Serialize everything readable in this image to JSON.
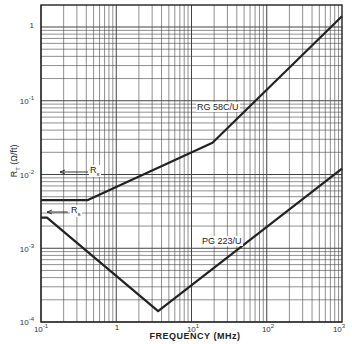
{
  "chart_data": {
    "type": "line",
    "title": "",
    "xlabel": "FREQUENCY (MHz)",
    "ylabel": "R_T (Ω/ft)",
    "xscale": "log",
    "yscale": "log",
    "xlim": [
      0.1,
      1000
    ],
    "ylim": [
      0.0001,
      2
    ],
    "grid": true,
    "x_tick_labels": [
      "10⁻¹",
      "1",
      "10¹",
      "10²",
      "10³"
    ],
    "y_tick_labels": [
      "1",
      "10⁻¹",
      "10⁻²",
      "10⁻³",
      "10⁻⁴"
    ],
    "series": [
      {
        "name": "RG 58C/U",
        "x": [
          0.1,
          0.42,
          19,
          1000
        ],
        "y": [
          0.0045,
          0.0045,
          0.027,
          1.4
        ]
      },
      {
        "name": "RG 223/U",
        "x": [
          0.1,
          0.12,
          3.6,
          1000
        ],
        "y": [
          0.0026,
          0.0026,
          0.00014,
          0.012
        ]
      }
    ],
    "annotations": [
      {
        "text": "RG 58C/U",
        "near": "upper curve, around 10 MHz"
      },
      {
        "text": "PG 223/U",
        "near": "lower curve, around 30 MHz"
      },
      {
        "text": "R_s",
        "near": "upper curve DC plateau"
      },
      {
        "text": "R_s",
        "near": "lower curve DC plateau"
      }
    ]
  },
  "labels": {
    "x_axis_title": "FREQUENCY (MHz)",
    "y_axis_title": "R",
    "y_axis_sub": "T",
    "y_axis_units": " (Ω/ft)",
    "series1": "RG 58C/U",
    "series2": "PG 223/U",
    "rs_label": "R",
    "rs_sub": "s",
    "xt0": "10",
    "xt0e": "-1",
    "xt1": "1",
    "xt2": "10",
    "xt2e": "1",
    "xt3": "10",
    "xt3e": "2",
    "xt4": "10",
    "xt4e": "3",
    "yt0": "1",
    "yt1": "10",
    "yt1e": "-1",
    "yt2": "10",
    "yt2e": "-2",
    "yt3": "10",
    "yt3e": "-3",
    "yt4": "10",
    "yt4e": "-4"
  }
}
